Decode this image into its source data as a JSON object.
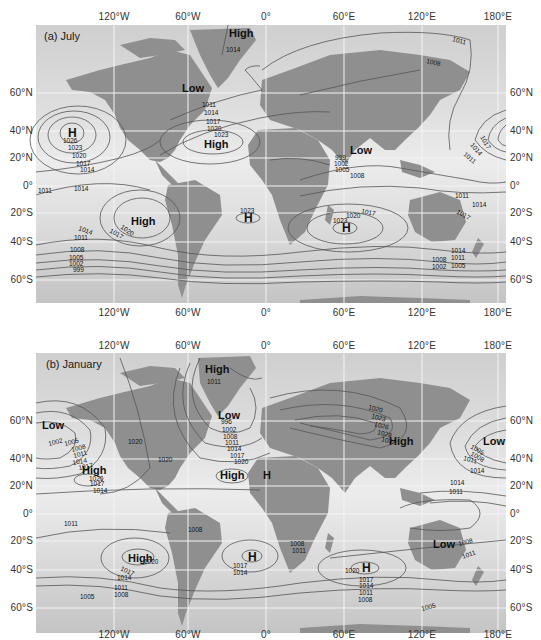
{
  "figure": {
    "colors": {
      "ocean_light": "#e6e6e6",
      "ocean_dark": "#c9c9c9",
      "land": "#8f8f8f",
      "isobar": "#555555",
      "grid": "#f4f4f4"
    },
    "units": "mb",
    "longitude_labels": [
      "120°W",
      "60°W",
      "0°",
      "60°E",
      "120°E",
      "180°E"
    ],
    "latitude_labels": [
      "60°N",
      "40°N",
      "20°N",
      "0°",
      "20°S",
      "40°S",
      "60°S"
    ],
    "panels": [
      {
        "id": "a",
        "title": "(a) July",
        "centers": [
          {
            "label": "High",
            "location": "Greenland"
          },
          {
            "label": "Low",
            "location": "Hudson Bay / northern Canada"
          },
          {
            "label": "H",
            "location": "North Pacific",
            "value_labels": [
              "1026",
              "1023",
              "1020",
              "1017",
              "1014"
            ]
          },
          {
            "label": "High",
            "location": "North Atlantic (Bermuda)"
          },
          {
            "label": "Low",
            "location": "South Asia"
          },
          {
            "label": "High",
            "location": "South Pacific"
          },
          {
            "label": "H",
            "location": "South Atlantic"
          },
          {
            "label": "H",
            "location": "South Indian Ocean"
          }
        ],
        "isobar_labels": {
          "greenland": [
            "1014"
          ],
          "north_atlantic": [
            "1011",
            "1014",
            "1017",
            "1020",
            "1023"
          ],
          "north_pacific": [
            "1026",
            "1023",
            "1020",
            "1017",
            "1014"
          ],
          "equatorial_pacific": [
            "1011",
            "1014"
          ],
          "south_pacific": [
            "1020",
            "1017",
            "1014",
            "1011",
            "1008",
            "1005",
            "1002",
            "999"
          ],
          "south_atlantic": [
            "1023"
          ],
          "south_asia": [
            "999",
            "1002",
            "1005",
            "1008"
          ],
          "siberia": [
            "1011",
            "1008"
          ],
          "northwest_pacific": [
            "1017",
            "1014",
            "1011"
          ],
          "western_pacific": [
            "1011",
            "1014",
            "1017"
          ],
          "south_indian": [
            "1017",
            "1020",
            "1023"
          ],
          "southern_ocean_east": [
            "1014",
            "1011",
            "1008",
            "1005",
            "1002"
          ]
        }
      },
      {
        "id": "b",
        "title": "(b) January",
        "centers": [
          {
            "label": "High",
            "location": "Greenland",
            "value_labels": [
              "1011"
            ]
          },
          {
            "label": "Low",
            "location": "Aleutian (Gulf of Alaska)"
          },
          {
            "label": "Low",
            "location": "Icelandic"
          },
          {
            "label": "High",
            "location": "Subtropical North Pacific"
          },
          {
            "label": "High",
            "location": "Azores"
          },
          {
            "label": "H",
            "location": "North Africa"
          },
          {
            "label": "High",
            "location": "Siberia"
          },
          {
            "label": "Low",
            "location": "Aleutian (west)"
          },
          {
            "label": "High",
            "location": "South Pacific"
          },
          {
            "label": "H",
            "location": "South Atlantic"
          },
          {
            "label": "Low",
            "location": "Australia"
          },
          {
            "label": "H",
            "location": "South Indian Ocean"
          }
        ],
        "isobar_labels": {
          "greenland": [
            "1011"
          ],
          "gulf_of_alaska": [
            "1002",
            "1005",
            "1008",
            "1011",
            "1014",
            "1017"
          ],
          "north_america": [
            "1020",
            "1020"
          ],
          "icelandic": [
            "996",
            "1002",
            "1008",
            "1011",
            "1014",
            "1017",
            "1020"
          ],
          "subtropical_pacific": [
            "1020",
            "1017",
            "1014"
          ],
          "siberia": [
            "1020",
            "1023",
            "1026",
            "1029",
            "1032"
          ],
          "aleutian_west": [
            "1005",
            "1008",
            "1011",
            "1014"
          ],
          "tropical_pacific_west": [
            "1014",
            "1011"
          ],
          "equatorial_pacific": [
            "1011"
          ],
          "south_pacific": [
            "1020",
            "1017",
            "1014",
            "1011",
            "1008",
            "1005"
          ],
          "south_america": [
            "1008"
          ],
          "south_atlantic": [
            "1017",
            "1014"
          ],
          "south_africa": [
            "1008",
            "1011"
          ],
          "south_indian": [
            "1020",
            "1017",
            "1014",
            "1011",
            "1008"
          ],
          "australia": [
            "1008",
            "1011"
          ],
          "southern_ocean": [
            "1005"
          ]
        }
      }
    ]
  }
}
